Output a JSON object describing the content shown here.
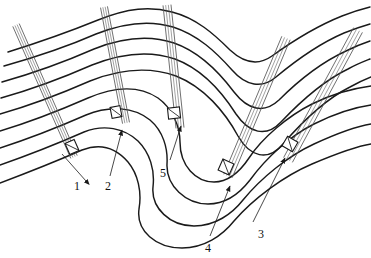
{
  "figure": {
    "type": "geological-cross-section",
    "background_color": "#ffffff",
    "stroke_color": "#1a1a1a",
    "borehole_stroke_color": "#555555",
    "width": 371,
    "height": 258
  },
  "strata": {
    "count": 9,
    "description": "Nested sub-parallel bedding traces forming an anticline on the left-upper limb, a tight hairpin syncline in the centre, and an up-turned limb on the right",
    "paths": [
      "M 8,52 C 40,42 66,33 98,20 C 128,8 150,6 172,12 C 196,18 214,34 230,50 C 244,63 258,66 272,56 C 290,43 312,28 342,16 C 352,12 362,9 370,7",
      "M 4,66 C 36,57 64,48 96,34 C 126,22 150,20 173,27 C 198,35 216,52 232,70 C 246,86 262,89 276,77 C 294,62 316,45 344,33 C 354,29 363,26 370,24",
      "M 2,82 C 34,73 62,63 94,49 C 124,37 150,35 174,43 C 200,52 219,72 234,92 C 248,110 264,114 279,100 C 297,82 320,63 346,51 C 356,46 364,43 370,41",
      "M 1,98 C 33,89 60,79 92,65 C 122,53 149,50 175,59 C 202,69 222,92 236,114 C 249,133 266,138 281,122 C 300,102 323,81 348,69 C 357,64 365,61 370,59",
      "M 0,114 C 32,105 58,95 90,81 C 120,69 148,66 176,76 C 204,87 225,112 238,136 C 250,157 268,162 283,144 C 302,122 326,99 350,87 C 359,82 366,79 371,77",
      "M 0,131 C 30,122 56,112 88,98 C 116,86 140,86 158,98 C 172,108 180,126 180,142 C 180,166 196,182 214,182 C 230,182 241,170 249,158 C 262,138 288,116 312,104 C 334,93 356,88 371,86",
      "M 0,148 C 28,139 54,129 86,115 C 110,105 134,107 150,120 C 163,131 168,148 167,164 C 166,186 186,204 208,204 C 226,204 240,193 250,180 C 266,158 290,136 314,124 C 336,113 357,107 371,105",
      "M 0,165 C 26,156 52,146 84,132 C 104,124 124,128 138,141 C 150,153 155,170 153,187 C 151,208 170,226 194,226 C 215,226 232,214 243,200 C 261,178 288,156 314,144 C 338,133 358,126 371,124",
      "M 0,183 C 24,174 50,164 82,150 C 100,143 116,148 128,162 C 138,174 142,192 139,209 C 136,231 156,248 182,248 C 204,248 222,236 234,221 C 254,198 284,176 312,164 C 338,153 358,146 371,144"
    ]
  },
  "boreholes": [
    {
      "id": "borehole-1",
      "label": "1",
      "label_pos": {
        "x": 74,
        "y": 180
      },
      "corridor": {
        "x1": 16,
        "y1": 25,
        "x2": 74,
        "y2": 157,
        "width": 7
      },
      "end_marker": {
        "x": 72,
        "y": 147,
        "w": 10,
        "h": 12,
        "angle": -24
      },
      "leader": {
        "x1": 86,
        "y1": 181,
        "x2": 62,
        "y2": 154
      },
      "arrow_at": "start"
    },
    {
      "id": "borehole-2",
      "label": "2",
      "label_pos": {
        "x": 105,
        "y": 180
      },
      "corridor": {
        "x1": 104,
        "y1": 7,
        "x2": 126,
        "y2": 123,
        "width": 7
      },
      "end_marker": {
        "x": 116,
        "y": 112,
        "w": 10,
        "h": 11,
        "angle": -11
      },
      "leader": {
        "x1": 110,
        "y1": 176,
        "x2": 122,
        "y2": 130
      },
      "arrow_at": "end"
    },
    {
      "id": "borehole-5",
      "label": "5",
      "label_pos": {
        "x": 160,
        "y": 167
      },
      "corridor": {
        "x1": 167,
        "y1": 5,
        "x2": 180,
        "y2": 128,
        "width": 8
      },
      "end_marker": {
        "x": 174,
        "y": 113,
        "w": 12,
        "h": 11,
        "angle": -6
      },
      "leader": {
        "x1": 170,
        "y1": 160,
        "x2": 181,
        "y2": 126
      },
      "arrow_at": "end"
    },
    {
      "id": "borehole-4",
      "label": "4",
      "label_pos": {
        "x": 205,
        "y": 242
      },
      "corridor": {
        "x1": 286,
        "y1": 38,
        "x2": 228,
        "y2": 176,
        "width": 9
      },
      "end_marker": {
        "x": 226,
        "y": 167,
        "w": 12,
        "h": 12,
        "angle": 24
      },
      "leader": {
        "x1": 210,
        "y1": 236,
        "x2": 230,
        "y2": 186
      },
      "arrow_at": "end"
    },
    {
      "id": "borehole-3",
      "label": "3",
      "label_pos": {
        "x": 258,
        "y": 228
      },
      "corridor": {
        "x1": 358,
        "y1": 30,
        "x2": 288,
        "y2": 160,
        "width": 10
      },
      "end_marker": {
        "x": 290,
        "y": 144,
        "w": 12,
        "h": 11,
        "angle": 30
      },
      "leader": {
        "x1": 253,
        "y1": 222,
        "x2": 285,
        "y2": 158
      },
      "arrow_at": "end"
    }
  ],
  "labels": [
    {
      "text": "1",
      "x": 74,
      "y": 180
    },
    {
      "text": "2",
      "x": 105,
      "y": 180
    },
    {
      "text": "3",
      "x": 258,
      "y": 228
    },
    {
      "text": "4",
      "x": 205,
      "y": 242
    },
    {
      "text": "5",
      "x": 160,
      "y": 167
    }
  ]
}
